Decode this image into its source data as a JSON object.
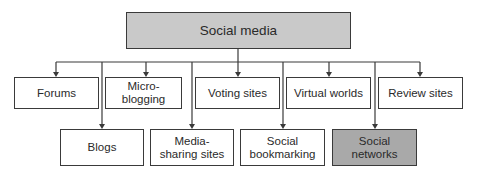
{
  "diagram": {
    "type": "hierarchy",
    "root": {
      "label": "Social media",
      "fill": "#c9c9c9"
    },
    "children_row1": [
      {
        "label": "Forums"
      },
      {
        "label": "Micro-blogging"
      },
      {
        "label": "Voting sites"
      },
      {
        "label": "Virtual worlds"
      },
      {
        "label": "Review sites"
      }
    ],
    "children_row2": [
      {
        "label": "Blogs"
      },
      {
        "label": "Media-sharing sites"
      },
      {
        "label": "Social bookmarking"
      },
      {
        "label": "Social networks",
        "fill": "#a9a9a9",
        "highlighted": true
      }
    ],
    "colors": {
      "line": "#3a3a3a",
      "root_fill": "#c9c9c9",
      "highlight_fill": "#a9a9a9"
    }
  }
}
